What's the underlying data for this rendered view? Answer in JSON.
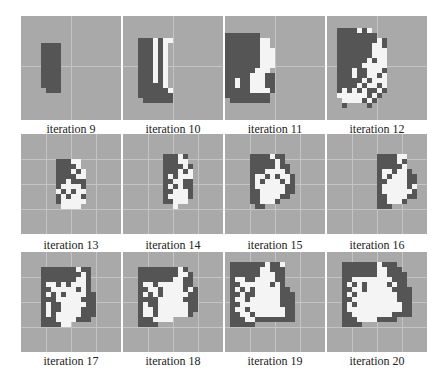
{
  "figure": {
    "colors": {
      "background": "#a9a9a9",
      "dark_cell": "#555555",
      "white_cell": "#f4f4f4",
      "gridline": "#c4c4c4"
    },
    "panels": [
      {
        "label": "iteration 9",
        "row": 0,
        "col": 0,
        "gridlines": {
          "v": [
            50
          ],
          "h": [
            50
          ]
        },
        "grid": [
          "....................",
          "....................",
          "....................",
          "....................",
          "....................",
          "....DDDD............",
          "....DDDD............",
          "....DDDD............",
          "....DDDD............",
          "....DDDD............",
          "....DDDD............",
          "....DDDD............",
          "....DDDD............",
          "....DDDD............",
          ".....DDD............",
          "....................",
          "....................",
          "....................",
          "....................",
          "...................."
        ]
      },
      {
        "label": "iteration 10",
        "row": 0,
        "col": 1,
        "gridlines": {
          "v": [
            50
          ],
          "h": [
            50
          ]
        },
        "grid": [
          "....................",
          "....................",
          "....................",
          "....................",
          "...DDDWDWW..........",
          "...DDDWDW...........",
          "...DDDWDW...........",
          "...DDDWDW...........",
          "...DDDWDW...........",
          "...DDDWDW...........",
          "...DDDWDW...........",
          "...DDDWDW...........",
          "...DDDWDW...........",
          "...DDDDDW...........",
          "...DDDDDDW..........",
          "...DDDDDDD..........",
          "....DDDDDD..........",
          "....................",
          "....................",
          "...................."
        ]
      },
      {
        "label": "iteration 11",
        "row": 0,
        "col": 2,
        "gridlines": {
          "v": [
            50
          ],
          "h": [
            50
          ]
        },
        "grid": [
          "....................",
          "....................",
          "....................",
          "DDDDDDD.............",
          "DDDDDDDWW...........",
          "DDDDDDDWW...........",
          "DDDDDDDWWW..........",
          "DDDDDDDWWW..........",
          "DDDDDDDWWW..........",
          "DDDDDDDWWW..........",
          "DDDDDDWWW...........",
          "DDDDDWWWDD..........",
          "DDWDDWWWDD..........",
          "DDWDDWWWDD..........",
          "DDDDDWWWWD..........",
          "DDDDDDDDD...........",
          ".DDDDDDDD...........",
          "....................",
          "....................",
          "...................."
        ]
      },
      {
        "label": "iteration 12",
        "row": 0,
        "col": 3,
        "gridlines": {
          "v": [
            50
          ],
          "h": [
            50
          ]
        },
        "grid": [
          "....................",
          "....................",
          "..DDDDWDW...........",
          "..DDDDDDDD..........",
          "..DDDDDDDDWD........",
          "..DDDDDDDWWD........",
          "..DDDDDDDWWW........",
          "..DDDDDDDWWW........",
          "..DDDDDDWDWW........",
          "..DDDDDWWWWW........",
          "..DDDWDDWWWD........",
          "..DDDWDDWWDW........",
          "..DDDDDWDWWW........",
          "..DDDDWDWWDW........",
          "..DWDWDWDDWD........",
          "..WWWWWWDWD.........",
          "...WWWWDWD..........",
          "...D....D...........",
          "....................",
          "...................."
        ]
      },
      {
        "label": "iteration 13",
        "row": 1,
        "col": 0,
        "gridlines": {
          "v": [
            25,
            50,
            75
          ],
          "h": [
            25,
            50,
            75
          ]
        },
        "grid": [
          "....................",
          "....................",
          "....................",
          "....................",
          "....................",
          ".......DDDWW........",
          ".......DDDDW........",
          ".......DDDWDW.......",
          ".......DDDDWW.......",
          ".......DDWDDD.......",
          ".......DWWWWD.......",
          ".......WDWDWW.......",
          ".......DWDWWD.......",
          ".......DWWWWW.......",
          "........WWWW........",
          "....................",
          "....................",
          "....................",
          "....................",
          "...................."
        ]
      },
      {
        "label": "iteration 14",
        "row": 1,
        "col": 1,
        "gridlines": {
          "v": [
            25,
            50,
            75
          ],
          "h": [
            25,
            50,
            75
          ]
        },
        "grid": [
          "....................",
          "....................",
          "....................",
          "....................",
          "........DDDWD.......",
          "........DDDWW.......",
          "........DDDDWD......",
          "........DDDWDW......",
          "........DWDWWW......",
          "........DDWWDD......",
          "........DWDWDD......",
          "........DDWWWD......",
          "........DWWWWD......",
          "........DDWWW.......",
          "..........W.........",
          "....................",
          "....................",
          "....................",
          "....................",
          "...................."
        ]
      },
      {
        "label": "iteration 15",
        "row": 1,
        "col": 2,
        "gridlines": {
          "v": [
            25,
            50,
            75
          ],
          "h": [
            25,
            50,
            75
          ]
        },
        "grid": [
          "....................",
          "....................",
          "....................",
          "....................",
          ".....DDDDWDD........",
          ".....DDDDDWD........",
          ".....DDDDDWDD.......",
          ".....DDDWWWWD.......",
          ".....DWWDWDWWD......",
          ".....DWDWWWDWD......",
          ".....DWWWWWWDD......",
          ".....DDWWWWWDD......",
          ".....DDWWWWDD.......",
          ".....DDWWWD.........",
          "......DD............",
          "....................",
          "....................",
          "....................",
          "....................",
          "...................."
        ]
      },
      {
        "label": "iteration 16",
        "row": 1,
        "col": 3,
        "gridlines": {
          "v": [
            25,
            50,
            75
          ],
          "h": [
            25,
            50,
            75
          ]
        },
        "grid": [
          "....................",
          "....................",
          "....................",
          "....................",
          "..........DDDDWW....",
          "..........DDDDWD....",
          "..........DDDDDW....",
          "..........DWWDWWD...",
          "..........DWDWWWDD..",
          "..........DDWWWWDD..",
          "..........DWWWWWDW..",
          "..........DWWWWWWD..",
          "..........DDWWWWDD..",
          "..........DDWWWD....",
          "..........DDD.......",
          "....................",
          "....................",
          "....................",
          "....................",
          "...................."
        ]
      },
      {
        "label": "iteration 17",
        "row": 2,
        "col": 0,
        "gridlines": {
          "v": [
            25,
            50,
            75
          ],
          "h": [
            25,
            50,
            75
          ]
        },
        "grid": [
          "....................",
          "....................",
          "....................",
          "....DDDDDDDWDD......",
          "....DDDDDDDDWD......",
          "....DDDDDDDWWD......",
          "....DWWDWDWWWD......",
          "....DDWWWWWDWD......",
          "....DWDWDWWWWDD.....",
          "....DDDWWWWWDDD.....",
          "....DWDDWWWWWDD.....",
          "....DWDDWWWWDDD.....",
          "....DWDWWWWWDDD.....",
          "....DDDWWWWDDD......",
          "....DDDDWW..........",
          "....................",
          "....................",
          "....................",
          "....................",
          "...................."
        ]
      },
      {
        "label": "iteration 18",
        "row": 2,
        "col": 1,
        "gridlines": {
          "v": [
            25,
            50,
            75
          ],
          "h": [
            25,
            50,
            75
          ]
        },
        "grid": [
          "....................",
          "....................",
          "....................",
          "...DDDDDDDDWD.......",
          "...DDDDDDDDWWD......",
          "...DDDDDDDWWDD......",
          "...DWWDWWWWWDD......",
          "...DDWWDWWWWDWD.....",
          "...DWDWDWWWWWDD.....",
          "...DDDDWWWWWDDD.....",
          "...DWDDWWWWWWDD.....",
          "...DWWDWWWWWWDD.....",
          "...DWWDWWWWWWD......",
          "...DDDWWWW..........",
          "...DDDD.............",
          "....................",
          "....................",
          "....................",
          "....................",
          "...................."
        ]
      },
      {
        "label": "iteration 19",
        "row": 2,
        "col": 2,
        "gridlines": {
          "v": [
            25,
            50,
            75
          ],
          "h": [
            25,
            50,
            75
          ]
        },
        "grid": [
          "....................",
          "....................",
          ".DDDDDDDWDDW........",
          ".DDDDDDWWDDD........",
          ".DDDDDDWWWDD........",
          ".DWWDDWWWWDD........",
          ".DDWWWWWWDWD........",
          ".DWDWDWWWWWDD.......",
          ".DDWDDWWWWWDDD......",
          ".DWWDWWWWWWDDD......",
          ".DDWWWWWWWWDDD......",
          ".DWWDWWWWWWWDD......",
          ".DDWWDWWWWWWDD......",
          ".DDDWWDDDDDDDD......",
          ".DDDDD..............",
          "....................",
          "....................",
          "....................",
          "....................",
          "...................."
        ]
      },
      {
        "label": "iteration 20",
        "row": 2,
        "col": 3,
        "gridlines": {
          "v": [
            25,
            50,
            75
          ],
          "h": [
            25,
            50,
            75
          ]
        },
        "grid": [
          "....................",
          "....................",
          "...DDDDDDDWDDD......",
          "...DDDDDDDWWDDD.....",
          "...DDDDDDDWWDDDD....",
          "...DDWWWWWWWWDDD....",
          "...DWDWDWWWWDWDD....",
          "...DDWWDWWWWWDDDD...",
          "...DWDWWWWWWWWDDD...",
          "...DDWWWWWWWWWDDD...",
          "...DWDWWWWWWWWWDD...",
          "...DWWWWWWWWWWWDD...",
          "...DDWWWWWWWWDDDD...",
          "...DDDWWWWDDDD......",
          "...DDDD.............",
          "....................",
          "....................",
          "....................",
          "....................",
          "...................."
        ]
      }
    ]
  }
}
